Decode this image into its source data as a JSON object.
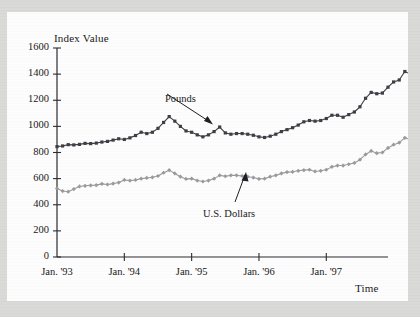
{
  "chart_data": {
    "type": "line",
    "title": "",
    "xlabel": "Time",
    "ylabel": "Index Value",
    "ylim": [
      0,
      1600
    ],
    "yticks": [
      0,
      200,
      400,
      600,
      800,
      1000,
      1200,
      1400,
      1600
    ],
    "ytick_labels": [
      "0",
      "200",
      "400",
      "600",
      "800",
      "1000",
      "1200",
      "1400",
      "1600"
    ],
    "xtick_labels": [
      "Jan. '93",
      "Jan. '94",
      "Jan. '95",
      "Jan. '96",
      "Jan. '97"
    ],
    "xtick_values": [
      0,
      12,
      24,
      36,
      48
    ],
    "xlim": [
      0,
      59
    ],
    "grid": false,
    "legend_position": "inline-annotations",
    "annotations": [
      {
        "text": "Pounds",
        "points_to_series": "Pounds"
      },
      {
        "text": "U.S. Dollars",
        "points_to_series": "U.S. Dollars"
      }
    ],
    "series": [
      {
        "name": "Pounds",
        "color": "#3c3c42",
        "marker": "square",
        "values": [
          845,
          850,
          860,
          858,
          862,
          870,
          868,
          872,
          880,
          885,
          895,
          905,
          900,
          912,
          930,
          955,
          945,
          955,
          985,
          1030,
          1075,
          1040,
          1000,
          965,
          955,
          935,
          920,
          935,
          960,
          995,
          950,
          940,
          945,
          945,
          940,
          932,
          920,
          915,
          925,
          940,
          960,
          975,
          990,
          1010,
          1035,
          1045,
          1040,
          1045,
          1060,
          1085,
          1085,
          1070,
          1090,
          1110,
          1150,
          1215,
          1260,
          1250,
          1255,
          1300,
          1340,
          1355,
          1420,
          1400,
          1545,
          1410,
          1415,
          1500
        ]
      },
      {
        "name": "U.S. Dollars",
        "color": "#9a9a9e",
        "marker": "diamond",
        "values": [
          525,
          505,
          500,
          520,
          540,
          545,
          548,
          550,
          560,
          555,
          562,
          570,
          590,
          585,
          590,
          600,
          605,
          610,
          620,
          645,
          665,
          640,
          615,
          598,
          600,
          585,
          578,
          585,
          600,
          625,
          618,
          625,
          625,
          620,
          615,
          608,
          598,
          600,
          615,
          625,
          640,
          650,
          652,
          660,
          665,
          668,
          655,
          660,
          668,
          690,
          700,
          700,
          710,
          720,
          745,
          785,
          812,
          795,
          800,
          835,
          860,
          875,
          912,
          900,
          975,
          915,
          928,
          1030
        ]
      }
    ]
  }
}
